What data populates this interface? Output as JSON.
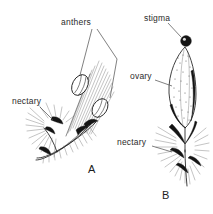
{
  "figure": {
    "background_color": "#ffffff",
    "ink_color": "#1f1f1f",
    "label_color": "#2b2b2b",
    "panels": [
      {
        "letter": "A",
        "name": "staminate-flower",
        "labels": [
          {
            "key": "anthers",
            "text": "anthers"
          },
          {
            "key": "nectary",
            "text": "nectary"
          }
        ]
      },
      {
        "letter": "B",
        "name": "pistillate-flower",
        "labels": [
          {
            "key": "stigma",
            "text": "stigma"
          },
          {
            "key": "ovary",
            "text": "ovary"
          },
          {
            "key": "nectary",
            "text": "nectary"
          }
        ]
      }
    ],
    "labels": {
      "anthers": "anthers",
      "nectary_a": "nectary",
      "stigma": "stigma",
      "ovary": "ovary",
      "nectary_b": "nectary",
      "letter_a": "A",
      "letter_b": "B"
    }
  }
}
